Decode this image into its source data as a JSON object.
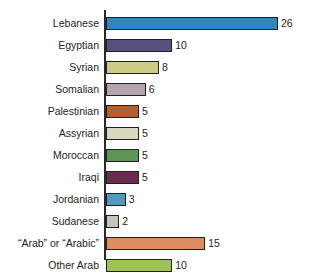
{
  "chart_data": {
    "type": "bar",
    "orientation": "horizontal",
    "title": "",
    "xlabel": "",
    "ylabel": "",
    "grid": false,
    "legend": false,
    "xlim": [
      0,
      26
    ],
    "categories": [
      "Lebanese",
      "Egyptian",
      "Syrian",
      "Somalian",
      "Palestinian",
      "Assyrian",
      "Moroccan",
      "Iraqi",
      "Jordanian",
      "Sudanese",
      "“Arab” or “Arabic”",
      "Other Arab"
    ],
    "values": [
      26,
      10,
      8,
      6,
      5,
      5,
      5,
      5,
      3,
      2,
      15,
      10
    ],
    "value_labels": [
      "26",
      "10",
      "8",
      "6",
      "5",
      "5",
      "5",
      "5",
      "3",
      "2",
      "15",
      "10"
    ],
    "bar_colors": [
      "#2e87bd",
      "#58507d",
      "#cdcc85",
      "#b5a3b0",
      "#b3602f",
      "#d8d8c0",
      "#5d9457",
      "#6b2a4e",
      "#4a9dbe",
      "#c4c6be",
      "#dd8d5e",
      "#9dc255"
    ],
    "bar_edge_color": "#231f20",
    "axis_color": "#2b2b2b",
    "text_color": "#231f20",
    "background": "#ffffff"
  }
}
